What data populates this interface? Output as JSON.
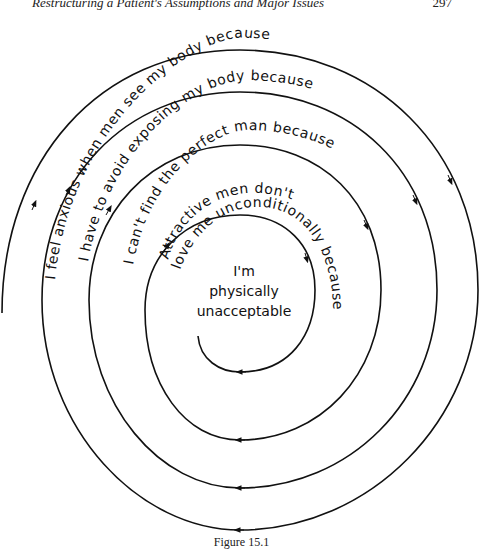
{
  "header": {
    "running_title": "Restructuring a Patient's Assumptions and Major Issues",
    "page_number": "297"
  },
  "diagram": {
    "type": "downward-arrow spiral",
    "direction": "clockwise, inward",
    "rings": [
      {
        "level": 1,
        "text": "I feel anxious when men see my body because"
      },
      {
        "level": 2,
        "text": "I have to avoid exposing my body because"
      },
      {
        "level": 3,
        "text": "I can't find the perfect man because"
      },
      {
        "level": 4,
        "text_line1": "Attractive men don't",
        "text_line2": "love me unconditionally because"
      }
    ],
    "core_belief": {
      "line1": "I'm",
      "line2": "physically",
      "line3": "unacceptable"
    }
  },
  "caption": "Figure 15.1"
}
